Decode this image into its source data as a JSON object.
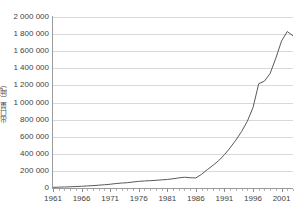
{
  "chart_data": {
    "type": "line",
    "title": "",
    "xlabel": "",
    "ylabel": "出口量（吨）",
    "xlim": [
      1961,
      2003
    ],
    "ylim": [
      0,
      2000000
    ],
    "grid": true,
    "legend": false,
    "y_ticks": [
      {
        "value": 2000000,
        "label": "2 000 000"
      },
      {
        "value": 1800000,
        "label": "1 800 000"
      },
      {
        "value": 1600000,
        "label": "1 600 000"
      },
      {
        "value": 1400000,
        "label": "1 400 000"
      },
      {
        "value": 1200000,
        "label": "1 200 000"
      },
      {
        "value": 1000000,
        "label": "1 000 000"
      },
      {
        "value": 800000,
        "label": "800 000"
      },
      {
        "value": 600000,
        "label": "600 000"
      },
      {
        "value": 400000,
        "label": "400 000"
      },
      {
        "value": 200000,
        "label": "200 000"
      },
      {
        "value": 0,
        "label": "0"
      }
    ],
    "x_ticks": [
      1961,
      1962,
      1963,
      1964,
      1965,
      1966,
      1967,
      1968,
      1969,
      1970,
      1971,
      1972,
      1973,
      1974,
      1975,
      1976,
      1977,
      1978,
      1979,
      1980,
      1981,
      1982,
      1983,
      1984,
      1985,
      1986,
      1987,
      1988,
      1989,
      1990,
      1991,
      1992,
      1993,
      1994,
      1995,
      1996,
      1997,
      1998,
      1999,
      2000,
      2001,
      2002,
      2003
    ],
    "x_tick_labels": [
      {
        "value": 1961,
        "label": "1961"
      },
      {
        "value": 1966,
        "label": "1966"
      },
      {
        "value": 1971,
        "label": "1971"
      },
      {
        "value": 1976,
        "label": "1976"
      },
      {
        "value": 1981,
        "label": "1981"
      },
      {
        "value": 1986,
        "label": "1986"
      },
      {
        "value": 1991,
        "label": "1991"
      },
      {
        "value": 1996,
        "label": "1996"
      },
      {
        "value": 2001,
        "label": "2001"
      }
    ],
    "series": [
      {
        "name": "出口量",
        "color": "#5a5a5a",
        "x": [
          1961,
          1962,
          1963,
          1964,
          1965,
          1966,
          1967,
          1968,
          1969,
          1970,
          1971,
          1972,
          1973,
          1974,
          1975,
          1976,
          1977,
          1978,
          1979,
          1980,
          1981,
          1982,
          1983,
          1984,
          1985,
          1986,
          1987,
          1988,
          1989,
          1990,
          1991,
          1992,
          1993,
          1994,
          1995,
          1996,
          1997,
          1998,
          1999,
          2000,
          2001,
          2002,
          2003
        ],
        "values": [
          8000,
          10000,
          12000,
          14000,
          17000,
          20000,
          24000,
          28000,
          33000,
          38000,
          44000,
          52000,
          58000,
          62000,
          70000,
          78000,
          82000,
          86000,
          90000,
          95000,
          100000,
          108000,
          118000,
          126000,
          120000,
          118000,
          160000,
          215000,
          265000,
          320000,
          390000,
          470000,
          560000,
          660000,
          780000,
          940000,
          1220000,
          1250000,
          1340000,
          1520000,
          1720000,
          1830000,
          1780000
        ]
      }
    ]
  }
}
